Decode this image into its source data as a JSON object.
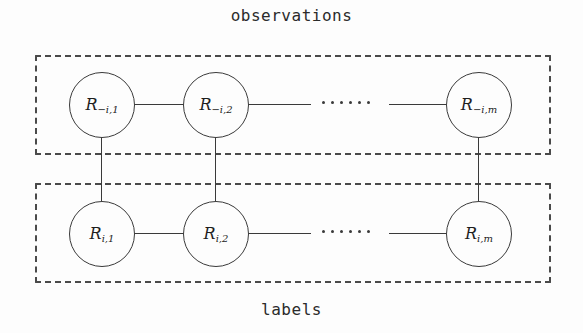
{
  "diagram": {
    "caption_top": "observations",
    "caption_bottom": "labels",
    "groups": [
      {
        "id": "observations",
        "name": "observations"
      },
      {
        "id": "labels",
        "name": "labels"
      }
    ],
    "nodes": {
      "top": [
        {
          "base": "R",
          "sub": "−i,1"
        },
        {
          "base": "R",
          "sub": "−i,2"
        },
        {
          "base": "R",
          "sub": "−i,m"
        }
      ],
      "bottom": [
        {
          "base": "R",
          "sub": "i,1"
        },
        {
          "base": "R",
          "sub": "i,2"
        },
        {
          "base": "R",
          "sub": "i,m"
        }
      ]
    },
    "ellipsis_dots": 6,
    "colors": {
      "background": "#fdfdfd",
      "stroke": "#3a3a3a",
      "dashed_border": "#4a4a4a",
      "text": "#1e1e1e"
    }
  }
}
